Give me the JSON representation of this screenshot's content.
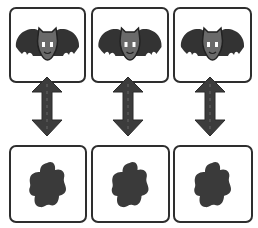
{
  "diagram": {
    "colors": {
      "outline": "#2e2e2e",
      "wing": "#333333",
      "head": "#6a6a6a",
      "eye": "#ffffff",
      "arrow": "#3c3c3c",
      "blob": "#3a3a3a",
      "background": "#ffffff"
    },
    "top_row": [
      {
        "icon": "bat-icon"
      },
      {
        "icon": "bat-icon"
      },
      {
        "icon": "bat-icon"
      }
    ],
    "connectors": [
      {
        "icon": "double-arrow-vertical-icon"
      },
      {
        "icon": "double-arrow-vertical-icon"
      },
      {
        "icon": "double-arrow-vertical-icon"
      }
    ],
    "bottom_row": [
      {
        "icon": "blob-icon"
      },
      {
        "icon": "blob-icon"
      },
      {
        "icon": "blob-icon"
      }
    ]
  }
}
